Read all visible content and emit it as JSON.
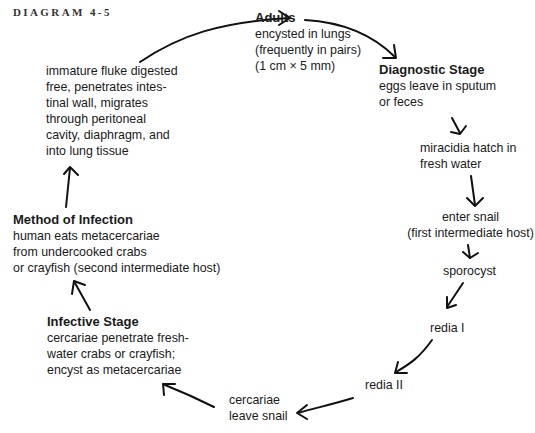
{
  "title": "DIAGRAM 4-5",
  "nodes": {
    "adults": {
      "head": "Adults",
      "lines": [
        "encysted in lungs",
        "(frequently in pairs)",
        "(1 cm × 5 mm)"
      ]
    },
    "diagnostic": {
      "head": "Diagnostic Stage",
      "lines": [
        "eggs leave in sputum",
        "or feces"
      ]
    },
    "miracidia": {
      "lines": [
        "miracidia hatch in",
        "fresh water"
      ]
    },
    "enter_snail": {
      "lines": [
        "enter snail",
        "(first intermediate host)"
      ]
    },
    "sporocyst": {
      "lines": [
        "sporocyst"
      ]
    },
    "redia1": {
      "lines": [
        "redia I"
      ]
    },
    "redia2": {
      "lines": [
        "redia II"
      ]
    },
    "cercariae": {
      "lines": [
        "cercariae",
        "leave snail"
      ]
    },
    "infective": {
      "head": "Infective Stage",
      "lines": [
        "cercariae penetrate fresh-",
        "water crabs or crayfish;",
        "encyst as metacercariae"
      ]
    },
    "method": {
      "head": "Method of Infection",
      "lines": [
        "human eats metacercariae",
        "from undercooked crabs",
        "or crayfish (second intermediate host)"
      ]
    },
    "immature": {
      "lines": [
        "immature fluke digested",
        "free, penetrates intes-",
        "tinal wall, migrates",
        "through peritoneal",
        "cavity, diaphragm, and",
        "into lung tissue"
      ]
    }
  },
  "arrow_icons": [
    "arrow-immature-to-adults",
    "arrow-adults-to-diagnostic",
    "arrow-diagnostic-to-miracidia",
    "arrow-miracidia-to-snail",
    "arrow-snail-to-sporocyst",
    "arrow-sporocyst-to-redia1",
    "arrow-redia1-to-redia2",
    "arrow-redia2-to-cercariae",
    "arrow-cercariae-to-infective",
    "arrow-infective-to-method",
    "arrow-method-to-immature"
  ]
}
